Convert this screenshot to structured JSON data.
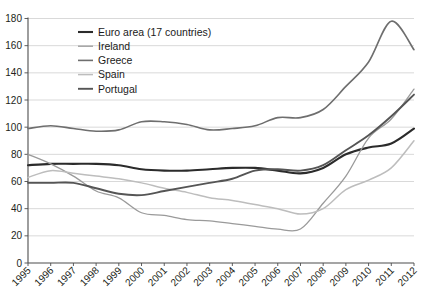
{
  "chart_data": {
    "type": "line",
    "title": "",
    "xlabel": "",
    "ylabel": "",
    "grid": "horizontal",
    "legend_position": "top-left-inside",
    "ylim": [
      0,
      180
    ],
    "yticks": [
      0,
      20,
      40,
      60,
      80,
      100,
      120,
      140,
      160,
      180
    ],
    "ytick_labels": [
      "0",
      "20",
      "40",
      "60",
      "80",
      "100",
      "120",
      "140",
      "160",
      "180"
    ],
    "x": [
      1995,
      1996,
      1997,
      1998,
      1999,
      2000,
      2001,
      2002,
      2003,
      2004,
      2005,
      2006,
      2007,
      2008,
      2009,
      2010,
      2011,
      2012
    ],
    "categories": [
      "1995",
      "1996",
      "1997",
      "1998",
      "1999",
      "2000",
      "2001",
      "2002",
      "2003",
      "2004",
      "2005",
      "2006",
      "2007",
      "2008",
      "2009",
      "2010",
      "2011",
      "2012"
    ],
    "series": [
      {
        "name": "Euro area (17 countries)",
        "color": "#2b2b2b",
        "width": 2.1,
        "values": [
          72,
          73,
          73,
          73,
          72,
          69,
          68,
          68,
          69,
          70,
          70,
          68,
          66,
          70,
          80,
          85,
          88,
          99
        ]
      },
      {
        "name": "Ireland",
        "color": "#9a9a9a",
        "width": 1.3,
        "values": [
          80,
          73,
          64,
          53,
          48,
          37,
          35,
          32,
          31,
          29,
          27,
          25,
          25,
          44,
          64,
          92,
          106,
          128
        ]
      },
      {
        "name": "Greece",
        "color": "#6e6e6e",
        "width": 1.6,
        "values": [
          99,
          101,
          99,
          97,
          98,
          104,
          104,
          102,
          98,
          99,
          101,
          107,
          107,
          113,
          130,
          148,
          178,
          157
        ]
      },
      {
        "name": "Spain",
        "color": "#bdbdbd",
        "width": 1.5,
        "values": [
          63,
          68,
          66,
          64,
          62,
          59,
          55,
          52,
          48,
          46,
          43,
          40,
          36,
          40,
          54,
          61,
          70,
          90
        ]
      },
      {
        "name": "Portugal",
        "color": "#555555",
        "width": 1.9,
        "values": [
          59,
          59,
          59,
          55,
          51,
          50,
          53,
          56,
          59,
          62,
          68,
          69,
          68,
          72,
          83,
          94,
          108,
          124
        ]
      }
    ]
  },
  "legend": {
    "items": [
      {
        "label": "Euro area (17 countries)",
        "color": "#2b2b2b"
      },
      {
        "label": "Ireland",
        "color": "#9a9a9a"
      },
      {
        "label": "Greece",
        "color": "#6e6e6e"
      },
      {
        "label": "Spain",
        "color": "#bdbdbd"
      },
      {
        "label": "Portugal",
        "color": "#555555"
      }
    ]
  }
}
